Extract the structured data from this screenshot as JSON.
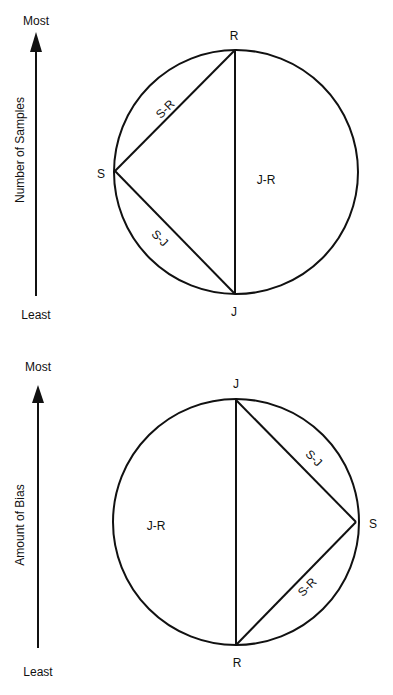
{
  "panels": [
    {
      "id": "samples",
      "axis": {
        "title": "Number of Samples",
        "top_label": "Most",
        "bottom_label": "Least"
      },
      "vertices": {
        "top": "R",
        "bottom": "J",
        "side": "S"
      },
      "segments": {
        "upper_chord": "S-R",
        "lower_chord": "S-J",
        "diameter": "J-R"
      }
    },
    {
      "id": "bias",
      "axis": {
        "title": "Amount of Bias",
        "top_label": "Most",
        "bottom_label": "Least"
      },
      "vertices": {
        "top": "J",
        "bottom": "R",
        "side": "S"
      },
      "segments": {
        "upper_chord": "S-J",
        "lower_chord": "S-R",
        "diameter": "J-R"
      }
    }
  ],
  "colors": {
    "stroke": "#111111",
    "background": "#ffffff"
  }
}
